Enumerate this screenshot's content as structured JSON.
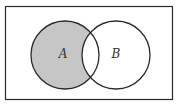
{
  "diagram": {
    "type": "venn",
    "shaded_region": "A minus B",
    "sets": [
      {
        "label": "A",
        "shaded": true
      },
      {
        "label": "B",
        "shaded": false
      }
    ],
    "colors": {
      "shade": "#c6c6c6",
      "stroke": "#2a2a2a",
      "background": "#ffffff"
    }
  }
}
